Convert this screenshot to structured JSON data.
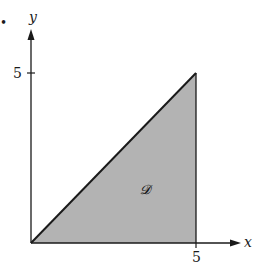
{
  "diagram": {
    "type": "region-plot",
    "axes": {
      "x_label": "x",
      "y_label": "y",
      "x_tick": "5",
      "y_tick": "5"
    },
    "region": {
      "label": "𝓓",
      "vertices": [
        [
          0,
          0
        ],
        [
          5,
          5
        ],
        [
          5,
          0
        ]
      ],
      "fill": "#b3b3b3",
      "stroke": "#1a1a1a"
    },
    "bullet": "•"
  }
}
